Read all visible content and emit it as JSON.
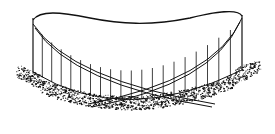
{
  "figure": {
    "colors": {
      "background": "#ffffff",
      "ink": "#111111"
    },
    "elements": {
      "roof_grid": {
        "longitudinal_lines": 17,
        "transverse_lines": 11
      },
      "wall_posts": 20,
      "arches": 2,
      "ground": "stippled"
    }
  }
}
